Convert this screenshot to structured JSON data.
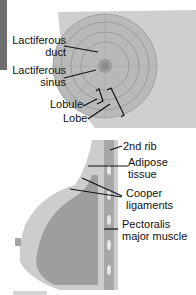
{
  "diagram": {
    "top_view_labels": {
      "lactiferous_duct": [
        "Lactiferous",
        "duct"
      ],
      "lactiferous_sinus": [
        "Lactiferous",
        "sinus"
      ],
      "lobule": "Lobule",
      "lobe": "Lobe"
    },
    "side_view_labels": {
      "second_rib": "2nd rib",
      "adipose_tissue": [
        "Adipose",
        "tissue"
      ],
      "cooper_ligaments": [
        "Cooper",
        "ligaments"
      ],
      "pectoralis_major": [
        "Pectoralis",
        "major muscle"
      ]
    }
  }
}
